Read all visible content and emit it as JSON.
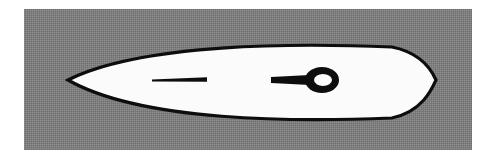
{
  "figure": {
    "caption": "",
    "kind": "line-drawing",
    "canvas": {
      "width": 497,
      "height": 158,
      "page_background": "#ffffff"
    },
    "panel": {
      "label": "gray halftone panel",
      "x": 24,
      "y": 9,
      "width": 448,
      "height": 141,
      "fill": "#7f7f7f",
      "dither": "checkerboard",
      "dither_light": "#8d8d8d",
      "dither_dark": "#6f6f6f"
    },
    "lens": {
      "label": "lens outline",
      "left_tip_x": 68,
      "right_tip_x": 436,
      "center_y": 80,
      "top_y": 43,
      "bottom_y": 122,
      "fill": "#fbfbfb",
      "stroke": "#0d0d0d",
      "stroke_width": 3.2
    },
    "dash_mark": {
      "label": "blade dash",
      "x1": 152,
      "y1": 80.5,
      "x2": 207,
      "y2": 79.5,
      "width_start": 2.1,
      "width_end": 4.4,
      "fill": "#0d0d0d"
    },
    "needle_eye": {
      "label": "needle eye glyph",
      "stem_x1": 271,
      "stem_x2": 310,
      "stem_y": 80,
      "stem_thickness": 8.5,
      "ring_cx": 322,
      "ring_cy": 80,
      "ring_rx": 17,
      "ring_ry": 13,
      "hole_rx": 9,
      "hole_ry": 6,
      "fill": "#0d0d0d",
      "hole_fill": "#fbfbfb"
    },
    "colors": {
      "ink": "#0d0d0d",
      "paper": "#fbfbfb",
      "panel_gray": "#7f7f7f",
      "page_white": "#ffffff"
    }
  }
}
